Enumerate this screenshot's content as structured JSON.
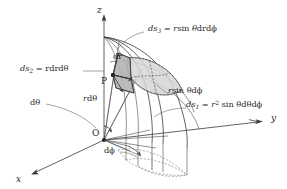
{
  "figure": {
    "background_color": "#ffffff",
    "line_color": "#3a3a3a",
    "patch_fill_color": "#d6d6d6",
    "patch_fill_color_dark": "#b4b4b4"
  },
  "axes": {
    "z": "z",
    "y": "y",
    "x": "x"
  },
  "points": {
    "origin": "O",
    "p": "P"
  },
  "labels": {
    "ds3_lhs": "ds",
    "ds3_sub": "3",
    "ds3_rhs": "= r sin θd rdϕ",
    "ds3_full": "ds₃ = r sin θdrdϕ",
    "ds2_full": "ds₂ = rdrdθ",
    "ds1_full": "ds₁ = r² sin θdθdϕ",
    "dr": "dr",
    "dtheta": "dθ",
    "dphi": "dϕ",
    "r_dtheta": "rdθ",
    "r_sin_theta_dphi": "r sin θdϕ"
  },
  "label_parts": {
    "ds3": {
      "name": "ds",
      "sub": "3",
      "eq": "=",
      "expr_a": "r",
      "expr_b": "sin",
      "expr_c": "θ",
      "expr_d": "drdϕ"
    },
    "ds2": {
      "name": "ds",
      "sub": "2",
      "eq": "=",
      "expr": "rdrdθ"
    },
    "ds1": {
      "name": "ds",
      "sub": "1",
      "eq": "=",
      "expr_r": "r",
      "sup": "2",
      "expr_sin": "sin",
      "expr_theta": "θdθdϕ"
    },
    "rsin": {
      "r": "r",
      "sin": "sin",
      "rest": "θdϕ"
    },
    "rdtheta": {
      "r": "r",
      "rest": "dθ"
    }
  }
}
